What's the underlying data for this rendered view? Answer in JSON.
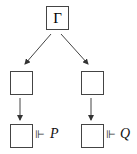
{
  "diagram": {
    "root": {
      "label": "Γ"
    },
    "left_branch": {
      "middle": {
        "label": ""
      },
      "bottom": {
        "label": "",
        "relation": "⊩",
        "formula": "P"
      }
    },
    "right_branch": {
      "middle": {
        "label": ""
      },
      "bottom": {
        "label": "",
        "relation": "⊩",
        "formula": "Q"
      }
    },
    "edges": [
      {
        "from": "root",
        "to": "left_middle"
      },
      {
        "from": "root",
        "to": "right_middle"
      },
      {
        "from": "left_middle",
        "to": "left_bottom"
      },
      {
        "from": "right_middle",
        "to": "right_bottom"
      }
    ],
    "colors": {
      "stroke": "#444444",
      "text": "#222222"
    }
  }
}
